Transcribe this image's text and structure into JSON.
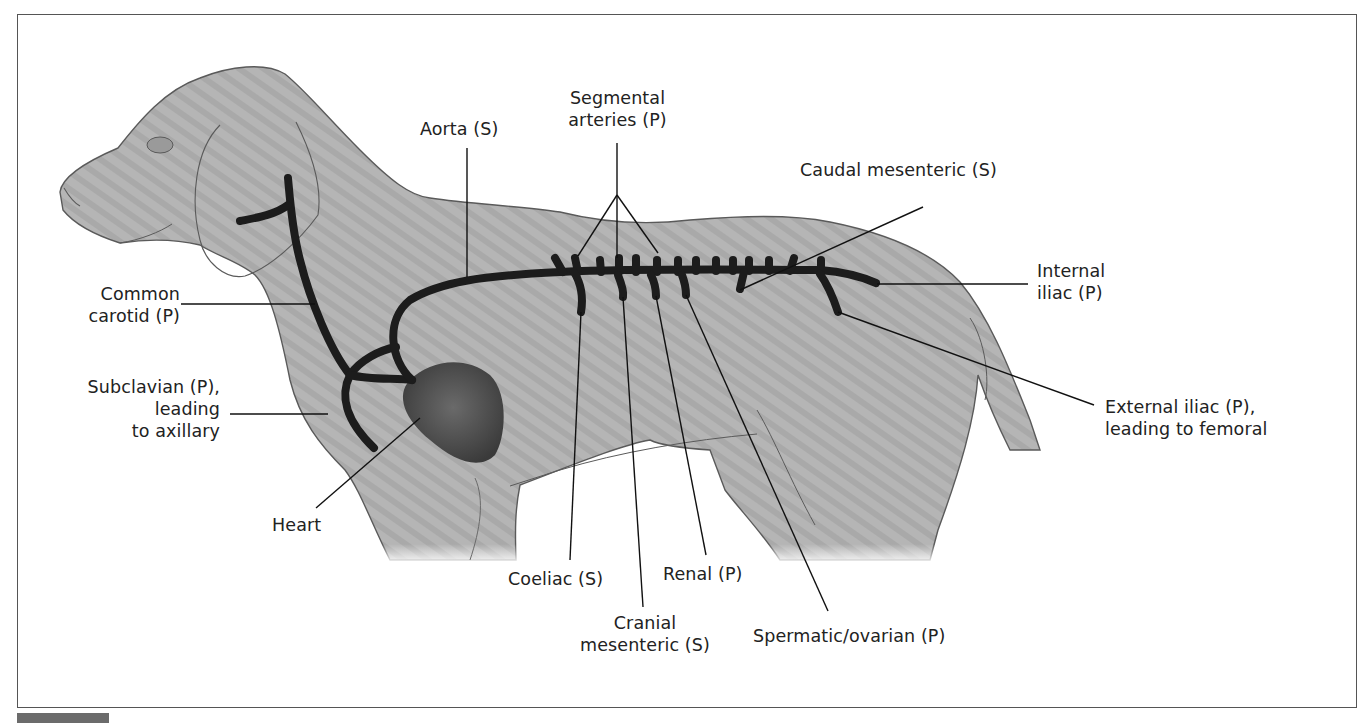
{
  "figure": {
    "colors": {
      "body_fill": "#b3b3b3",
      "body_outline": "#5a5a5a",
      "artery": "#1c1c1c",
      "heart": "#4a4a4a",
      "leader_line": "#111111",
      "text": "#222222",
      "frame": "#555555"
    }
  },
  "labels": {
    "common_carotid": {
      "line1": "Common",
      "line2": "carotid (P)"
    },
    "subclavian": {
      "line1": "Subclavian (P),",
      "line2": "leading",
      "line3": "to axillary"
    },
    "heart": {
      "line1": "Heart"
    },
    "aorta": {
      "line1": "Aorta (S)"
    },
    "segmental": {
      "line1": "Segmental",
      "line2": "arteries (P)"
    },
    "caudal_mesenteric": {
      "line1": "Caudal mesenteric (S)"
    },
    "internal_iliac": {
      "line1": "Internal",
      "line2": "iliac (P)"
    },
    "external_iliac": {
      "line1": "External iliac (P),",
      "line2": "leading to femoral"
    },
    "coeliac": {
      "line1": "Coeliac (S)"
    },
    "cranial_mesenteric": {
      "line1": "Cranial",
      "line2": "mesenteric (S)"
    },
    "renal": {
      "line1": "Renal (P)"
    },
    "spermatic_ovarian": {
      "line1": "Spermatic/ovarian (P)"
    }
  }
}
